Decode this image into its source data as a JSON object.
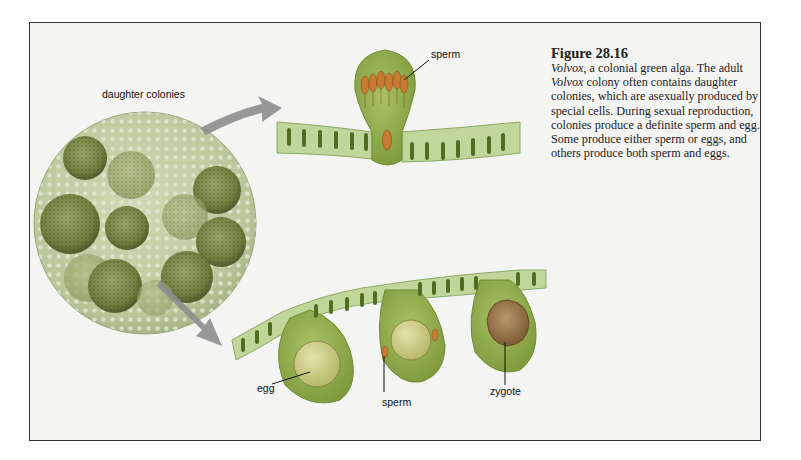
{
  "figure": {
    "number": "Figure 28.16",
    "caption_parts": {
      "italic_1": "Volvox",
      "text_1": ", a colonial green alga. The adult ",
      "italic_2": "Volvox",
      "text_2": " colony often contains daughter colonies, which are asexually produced by special cells. During sexual reproduction, colonies produce a definite sperm and egg. Some produce either sperm or eggs, and others produce both sperm and eggs."
    }
  },
  "labels": {
    "daughter_colonies": "daughter colonies",
    "sperm_top": "sperm",
    "egg": "egg",
    "sperm_bottom": "sperm",
    "zygote": "zygote"
  },
  "colors": {
    "frame_bg": "#f4f4f2",
    "cell_green": "#b8cf8a",
    "nucleus": "#5b7a2c",
    "bulb_green": "#8fae4e",
    "sperm_orange": "#d68a3a",
    "egg": "#c9cf7a",
    "zygote": "#a0703a",
    "arrow": "#8a8a8a"
  }
}
